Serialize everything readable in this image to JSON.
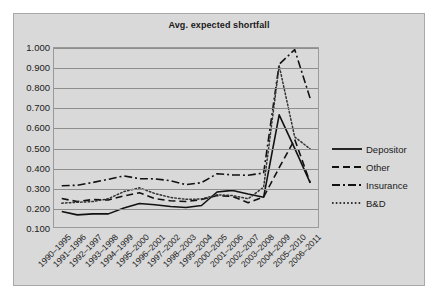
{
  "chart_data": {
    "type": "line",
    "title": "Avg. expected shortfall",
    "xlabel": "",
    "ylabel": "",
    "ylim": [
      0.1,
      1.0
    ],
    "ytick_labels": [
      "1.000",
      "0.900",
      "0.800",
      "0.700",
      "0.600",
      "0.500",
      "0.400",
      "0.300",
      "0.200",
      "0.100"
    ],
    "ytick_values": [
      1.0,
      0.9,
      0.8,
      0.7,
      0.6,
      0.5,
      0.4,
      0.3,
      0.2,
      0.1
    ],
    "grid": true,
    "legend_position": "right",
    "categories": [
      "1990–1995",
      "1991–1996",
      "1992–1997",
      "1993–1998",
      "1994–1999",
      "1995–2000",
      "1996–2001",
      "1997–2002",
      "1998–2003",
      "1999–2004",
      "2000–2005",
      "2001–2006",
      "2002–2007",
      "2003–2008",
      "2004–2009",
      "2005–2010",
      "2006–2011"
    ],
    "series": [
      {
        "name": "Depositor",
        "style": "solid",
        "color": "#111111",
        "values": [
          0.178,
          0.161,
          0.166,
          0.166,
          0.196,
          0.218,
          0.212,
          0.203,
          0.198,
          0.208,
          0.276,
          0.284,
          0.266,
          0.25,
          0.664,
          0.495,
          0.322
        ]
      },
      {
        "name": "Other",
        "style": "dashed",
        "color": "#111111",
        "values": [
          0.243,
          0.228,
          0.238,
          0.236,
          0.256,
          0.272,
          0.243,
          0.232,
          0.228,
          0.238,
          0.258,
          0.254,
          0.222,
          0.251,
          0.398,
          0.54,
          0.322
        ]
      },
      {
        "name": "Insurance",
        "style": "dashdot",
        "color": "#111111",
        "values": [
          0.307,
          0.31,
          0.324,
          0.34,
          0.357,
          0.343,
          0.342,
          0.333,
          0.313,
          0.323,
          0.368,
          0.362,
          0.36,
          0.372,
          0.918,
          0.992,
          0.745
        ]
      },
      {
        "name": "B&D",
        "style": "dotted",
        "color": "#333333",
        "values": [
          0.22,
          0.224,
          0.228,
          0.242,
          0.278,
          0.297,
          0.268,
          0.249,
          0.239,
          0.241,
          0.262,
          0.258,
          0.242,
          0.3,
          0.912,
          0.553,
          0.492
        ]
      }
    ]
  },
  "legend": {
    "items": [
      {
        "label": "Depositor"
      },
      {
        "label": "Other"
      },
      {
        "label": "Insurance"
      },
      {
        "label": "B&D"
      }
    ]
  }
}
